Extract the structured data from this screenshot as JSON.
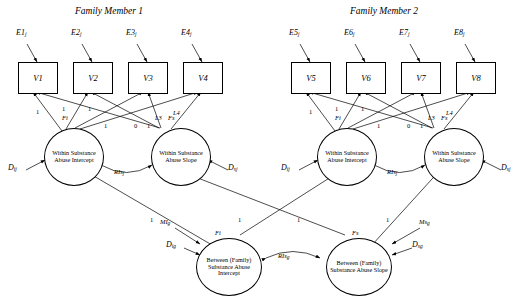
{
  "diagram": {
    "type": "path-diagram",
    "titles": [
      {
        "id": "fam1",
        "text": "Family Member 1"
      },
      {
        "id": "fam2",
        "text": "Family Member 2"
      }
    ],
    "residuals": [
      {
        "id": "E1",
        "base": "E",
        "sub": "j"
      },
      {
        "id": "E2",
        "base": "E",
        "sub": "j"
      },
      {
        "id": "E3",
        "base": "E",
        "sub": "j"
      },
      {
        "id": "E4",
        "base": "E",
        "sub": "j"
      },
      {
        "id": "E5",
        "base": "E",
        "sub": "j"
      },
      {
        "id": "E6",
        "base": "E",
        "sub": "j"
      },
      {
        "id": "E7",
        "base": "E",
        "sub": "j"
      },
      {
        "id": "E8",
        "base": "E",
        "sub": "j"
      }
    ],
    "indicators": [
      {
        "id": "V1",
        "label": "V1"
      },
      {
        "id": "V2",
        "label": "V2"
      },
      {
        "id": "V3",
        "label": "V3"
      },
      {
        "id": "V4",
        "label": "V4"
      },
      {
        "id": "V5",
        "label": "V5"
      },
      {
        "id": "V6",
        "label": "V6"
      },
      {
        "id": "V7",
        "label": "V7"
      },
      {
        "id": "V8",
        "label": "V8"
      }
    ],
    "latents": [
      {
        "id": "fi1",
        "tag": "Fi",
        "text": "Within Substance Abuse Intercept"
      },
      {
        "id": "fs1",
        "tag": "Fs",
        "text": "Within Substance Abuse Slope"
      },
      {
        "id": "fi2",
        "tag": "Fi",
        "text": "Within Substance Abuse Intercept"
      },
      {
        "id": "fs2",
        "tag": "Fs",
        "text": "Within Substance Abuse Slope"
      },
      {
        "id": "bfi",
        "tag": "Fi",
        "text": "Between (Family) Substance Abuse Intercept"
      },
      {
        "id": "bfs",
        "tag": "Fs",
        "text": "Between (Family) Substance Abuse Slope"
      }
    ],
    "disturbances": [
      {
        "id": "Di1",
        "base": "D",
        "sub": "i",
        "sup": "j"
      },
      {
        "id": "Ds1",
        "base": "D",
        "sub": "s",
        "sup": "j"
      },
      {
        "id": "Di2",
        "base": "D",
        "sub": "i",
        "sup": "j"
      },
      {
        "id": "Ds2",
        "base": "D",
        "sub": "s",
        "sup": "j"
      },
      {
        "id": "Dig",
        "base": "D",
        "sub": "ig"
      },
      {
        "id": "Dsg",
        "base": "D",
        "sub": "sg"
      }
    ],
    "covariances": [
      {
        "id": "ris1",
        "base": "RIs",
        "sub": "j"
      },
      {
        "id": "ris2",
        "base": "RIs",
        "sub": "j"
      },
      {
        "id": "risg",
        "base": "RIs",
        "sub": "g"
      }
    ],
    "means": [
      {
        "id": "mig",
        "base": "MI",
        "sub": "g"
      },
      {
        "id": "msg",
        "base": "Ms",
        "sub": "g"
      }
    ],
    "loading_labels": [
      {
        "id": "L3a",
        "base": "L3"
      },
      {
        "id": "L4a",
        "base": "L4"
      },
      {
        "id": "L3b",
        "base": "L3"
      },
      {
        "id": "L4b",
        "base": "L4"
      }
    ],
    "path_values": {
      "within1_intercept": [
        "1",
        "1",
        "1",
        "1"
      ],
      "within1_slope": [
        "0",
        "1"
      ],
      "within2_intercept": [
        "1",
        "1",
        "1",
        "1"
      ],
      "within2_slope": [
        "0",
        "1"
      ],
      "between_to_within": [
        "1",
        "1",
        "1",
        "1"
      ]
    }
  }
}
